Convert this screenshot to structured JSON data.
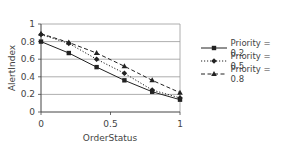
{
  "chart_data": {
    "type": "line",
    "title": "",
    "xlabel": "OrderStatus",
    "ylabel": "AlertIndex",
    "xlim": [
      0,
      1
    ],
    "ylim": [
      0,
      1
    ],
    "x_ticks": [
      "0",
      "0.5",
      "1"
    ],
    "y_ticks": [
      "0",
      "0.2",
      "0.4",
      "0.6",
      "0.8",
      "1"
    ],
    "grid": "horizontal",
    "legend_position": "right",
    "x": [
      0,
      0.2,
      0.4,
      0.6,
      0.8,
      1.0
    ],
    "series": [
      {
        "name": "Priority = 0.2",
        "style": "solid",
        "marker": "square",
        "values": [
          0.8,
          0.67,
          0.51,
          0.36,
          0.23,
          0.14
        ]
      },
      {
        "name": "Priority = 0.5",
        "style": "dotted",
        "marker": "diamond",
        "values": [
          0.88,
          0.78,
          0.6,
          0.44,
          0.25,
          0.16
        ]
      },
      {
        "name": "Priority = 0.8",
        "style": "dashed",
        "marker": "triangle",
        "values": [
          0.89,
          0.79,
          0.67,
          0.52,
          0.36,
          0.22
        ]
      }
    ]
  },
  "colors": {
    "line": "#222222",
    "grid": "#999999",
    "axis": "#444444"
  }
}
